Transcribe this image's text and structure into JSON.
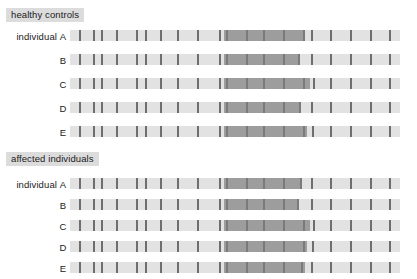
{
  "figure": {
    "type": "haplotype-sharing-diagram",
    "width": 417,
    "height": 279,
    "background": "#ffffff"
  },
  "colors": {
    "header_chip_bg": "#dcdcdc",
    "bar_light": "#e2e2e2",
    "shared_block": "#9d9d9d",
    "marker_tick": "#6e6e6e",
    "text": "#1a1a1a"
  },
  "geometry": {
    "bar_left": 70,
    "bar_right": 400,
    "bar_width": 330,
    "bar_height": 11,
    "row_pitch": 24
  },
  "labels": {
    "individual_prefix": "individual"
  },
  "sections": [
    {
      "id": "healthy-controls",
      "title": "healthy controls",
      "header_x": 6,
      "header_y": 8,
      "first_row_y": 30,
      "rows": [
        {
          "letter": "A",
          "y": 30,
          "shared": {
            "start": 224,
            "end": 305
          },
          "ticks": [
            79,
            93,
            101,
            116,
            136,
            145,
            160,
            177,
            197,
            219,
            226,
            246,
            263,
            283,
            303,
            311,
            330,
            350,
            370,
            389
          ]
        },
        {
          "letter": "B",
          "y": 54,
          "shared": {
            "start": 224,
            "end": 300
          },
          "ticks": [
            79,
            93,
            101,
            116,
            136,
            145,
            160,
            177,
            197,
            219,
            226,
            246,
            263,
            283,
            298,
            311,
            330,
            350,
            370,
            389
          ]
        },
        {
          "letter": "C",
          "y": 78,
          "shared": {
            "start": 224,
            "end": 310
          },
          "ticks": [
            79,
            93,
            101,
            116,
            136,
            145,
            160,
            177,
            197,
            219,
            226,
            246,
            263,
            283,
            303,
            313,
            330,
            350,
            370,
            389
          ]
        },
        {
          "letter": "D",
          "y": 102,
          "shared": {
            "start": 224,
            "end": 301
          },
          "ticks": [
            79,
            93,
            101,
            116,
            136,
            145,
            160,
            177,
            197,
            219,
            226,
            246,
            263,
            283,
            299,
            311,
            330,
            350,
            370,
            389
          ]
        },
        {
          "letter": "E",
          "y": 126,
          "shared": {
            "start": 224,
            "end": 307
          },
          "ticks": [
            79,
            93,
            101,
            116,
            136,
            145,
            160,
            177,
            197,
            219,
            226,
            246,
            263,
            283,
            303,
            312,
            330,
            350,
            370,
            389
          ]
        }
      ]
    },
    {
      "id": "affected-individuals",
      "title": "affected individuals",
      "header_x": 6,
      "header_y": 152,
      "first_row_y": 178,
      "rows": [
        {
          "letter": "A",
          "y": 178,
          "shared": {
            "start": 224,
            "end": 302
          },
          "ticks": [
            79,
            93,
            101,
            116,
            136,
            145,
            160,
            177,
            197,
            219,
            226,
            246,
            263,
            283,
            300,
            311,
            330,
            350,
            370,
            389
          ]
        },
        {
          "letter": "B",
          "y": 199,
          "shared": {
            "start": 224,
            "end": 299
          },
          "ticks": [
            79,
            93,
            101,
            116,
            136,
            145,
            160,
            177,
            197,
            219,
            226,
            246,
            263,
            283,
            297,
            311,
            330,
            350,
            370,
            389
          ]
        },
        {
          "letter": "C",
          "y": 220,
          "shared": {
            "start": 224,
            "end": 310
          },
          "ticks": [
            79,
            93,
            101,
            116,
            136,
            145,
            160,
            177,
            197,
            219,
            226,
            246,
            263,
            283,
            303,
            313,
            330,
            350,
            370,
            389
          ]
        },
        {
          "letter": "D",
          "y": 241,
          "shared": {
            "start": 224,
            "end": 307
          },
          "ticks": [
            79,
            93,
            101,
            116,
            136,
            145,
            160,
            177,
            197,
            219,
            226,
            246,
            263,
            283,
            303,
            312,
            330,
            350,
            370,
            389
          ]
        },
        {
          "letter": "E",
          "y": 262,
          "shared": {
            "start": 224,
            "end": 305
          },
          "ticks": [
            79,
            93,
            101,
            116,
            136,
            145,
            160,
            177,
            197,
            219,
            226,
            246,
            263,
            283,
            301,
            311,
            330,
            350,
            370,
            389
          ]
        }
      ]
    }
  ]
}
